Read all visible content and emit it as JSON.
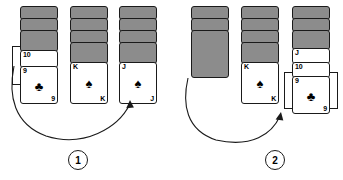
{
  "figure": {
    "type": "solitaire-move-diagram",
    "width": 343,
    "height": 180,
    "background": "#ffffff",
    "ink": "#1a1a1a",
    "cardback_fill": "#8c8c8c",
    "cardface_fill": "#ffffff"
  },
  "panels": [
    {
      "id": "panel-1",
      "step_label": "1",
      "caption": "",
      "piles": [
        {
          "id": "panel1-pile-1",
          "facedown_count": 3,
          "faceup": [
            {
              "rank": "10",
              "suit": "",
              "suit_glyph": "",
              "show_pip": false,
              "show_rank_br": false
            },
            {
              "rank": "9",
              "suit": "clubs",
              "suit_glyph": "♣",
              "show_pip": true,
              "show_rank_br": true
            }
          ],
          "bracketed": true,
          "bracket_side": "left"
        },
        {
          "id": "panel1-pile-2",
          "facedown_count": 4,
          "faceup": [
            {
              "rank": "K",
              "suit": "spades",
              "suit_glyph": "♠",
              "show_pip": true,
              "show_rank_br": true
            }
          ],
          "bracketed": false,
          "bracket_side": ""
        },
        {
          "id": "panel1-pile-3",
          "facedown_count": 4,
          "faceup": [
            {
              "rank": "J",
              "suit": "spades",
              "suit_glyph": "♠",
              "show_pip": true,
              "show_rank_br": true
            }
          ],
          "bracketed": false,
          "bracket_side": ""
        }
      ],
      "arrow": {
        "from_pile": "panel1-pile-1",
        "to_pile": "panel1-pile-3",
        "direction": "curve-right-up"
      }
    },
    {
      "id": "panel-2",
      "step_label": "2",
      "caption": "",
      "piles": [
        {
          "id": "panel2-pile-1",
          "facedown_count": 3,
          "faceup": [],
          "bracketed": false,
          "bracket_side": ""
        },
        {
          "id": "panel2-pile-2",
          "facedown_count": 4,
          "faceup": [
            {
              "rank": "K",
              "suit": "spades",
              "suit_glyph": "♠",
              "show_pip": true,
              "show_rank_br": true
            }
          ],
          "bracketed": false,
          "bracket_side": ""
        },
        {
          "id": "panel2-pile-3",
          "facedown_count": 3,
          "faceup": [
            {
              "rank": "J",
              "suit": "",
              "suit_glyph": "",
              "show_pip": false,
              "show_rank_br": false
            },
            {
              "rank": "10",
              "suit": "",
              "suit_glyph": "",
              "show_pip": false,
              "show_rank_br": false
            },
            {
              "rank": "9",
              "suit": "clubs",
              "suit_glyph": "♣",
              "show_pip": true,
              "show_rank_br": true
            }
          ],
          "bracketed": true,
          "bracket_side": "both"
        }
      ],
      "arrow": {
        "from_pile": "panel2-pile-1",
        "to_pile": "panel2-pile-3",
        "direction": "curve-right-up"
      }
    }
  ],
  "labels": {
    "p1_c1_fd1": "",
    "p1_c1_fd2": "",
    "p1_c1_fd3": "",
    "p1_c1_r10": "10",
    "p1_c1_r9": "9",
    "p1_c1_r9br": "9",
    "p1_c1_pip9": "♣",
    "p1_c2_K": "K",
    "p1_c2_Kbr": "K",
    "p1_c2_pipK": "♠",
    "p1_c3_J": "J",
    "p1_c3_Jbr": "J",
    "p1_c3_pipJ": "♠",
    "p2_c2_K": "K",
    "p2_c2_Kbr": "K",
    "p2_c2_pipK": "♠",
    "p2_c3_J": "J",
    "p2_c3_r10": "10",
    "p2_c3_r9": "9",
    "p2_c3_r9br": "9",
    "p2_c3_pip9": "♣",
    "step1": "1",
    "step2": "2"
  }
}
